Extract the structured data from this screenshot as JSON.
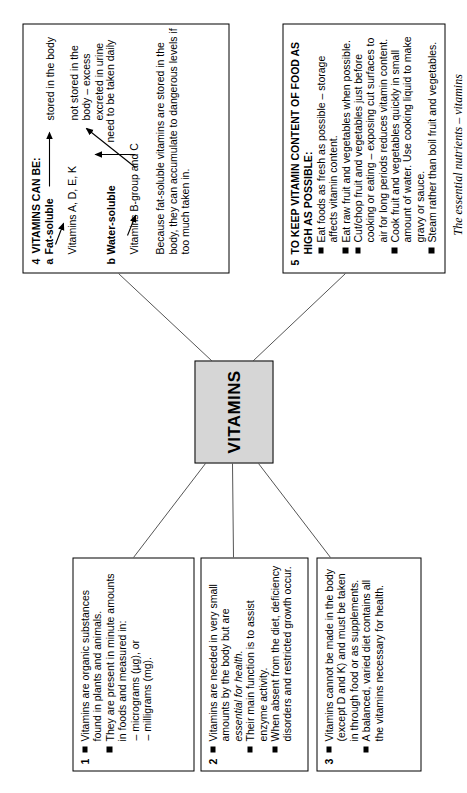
{
  "page": {
    "caption": "The essential nutrients – vitamins",
    "central_node": "VITAMINS",
    "central_fill": "#d6d6d6",
    "line_color": "#555555",
    "border_color": "#000000",
    "background": "#ffffff"
  },
  "boxes": {
    "box1": {
      "number": "1",
      "bullets": [
        "Vitamins are organic substances found in plants and animals.",
        "They are present in minute amounts in foods and measured in:"
      ],
      "sub_items": [
        "– micrograms (µg), or",
        "– milligrams (mg)."
      ]
    },
    "box2": {
      "number": "2",
      "bullets": [
        "Vitamins are needed in very small amounts by the body but are essential for health.",
        "Their main function is to assist enzyme activity.",
        "When absent from the diet, deficiency disorders and restricted growth occur."
      ],
      "italic_fragment": "essential for health."
    },
    "box3": {
      "number": "3",
      "bullets": [
        "Vitamins cannot be made in the body (except D and K) and must be taken in through food or as supplements.",
        "A balanced, varied diet contains all the vitamins necessary for health."
      ]
    },
    "box4": {
      "number": "4",
      "title": "VITAMINS CAN BE:",
      "item_a_letter": "a",
      "item_a_label": "Fat-soluble",
      "item_a_detail": "Vitamins A, D, E, K",
      "item_a_arrow_text": "stored in the body",
      "item_b_letter": "b",
      "item_b_label": "Water-soluble",
      "item_b_detail": "Vitamins B-group and C",
      "item_b_arrow_text_1": "not stored in the body – excess excreted in urine",
      "item_b_arrow_text_2": "need to be taken daily",
      "note": "Because fat-soluble vitamins are stored in the body, they can accumulate to dangerous levels if too much taken in."
    },
    "box5": {
      "number": "5",
      "title": "TO KEEP VITAMIN CONTENT OF FOOD AS HIGH AS POSSIBLE:",
      "bullets": [
        "Eat foods as fresh as possible – storage affects vitamin content.",
        "Eat raw fruit and vegetables when possible.",
        "Cut/chop fruit and vegetables just before cooking or eating – exposing cut surfaces to air for long periods reduces vitamin content.",
        "Cook fruit and vegetables quickly in small amount of water. Use cooking liquid to make gravy or sauce.",
        "Steam rather than boil fruit and vegetables."
      ]
    }
  }
}
